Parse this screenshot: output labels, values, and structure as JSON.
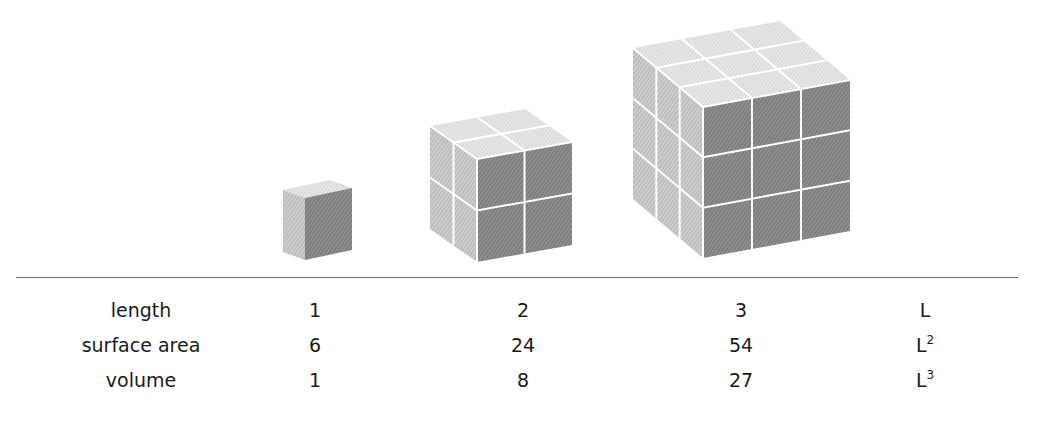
{
  "figure": {
    "title": "",
    "colors": {
      "top_face": "#e4e4e4",
      "left_face": "#c8c8c8",
      "front_face": "#8a8a8a",
      "grid_lines": "#ffffff",
      "divider": "#6d6d6d",
      "text": "#1a1a1a"
    },
    "cubes": [
      {
        "name": "cube-length-1",
        "subdivisions": 1
      },
      {
        "name": "cube-length-2",
        "subdivisions": 2
      },
      {
        "name": "cube-length-3",
        "subdivisions": 3
      }
    ]
  },
  "table": {
    "rows": [
      {
        "label": "length",
        "values": [
          "1",
          "2",
          "3"
        ],
        "general": "L",
        "exponent": ""
      },
      {
        "label": "surface area",
        "values": [
          "6",
          "24",
          "54"
        ],
        "general": "L",
        "exponent": "2"
      },
      {
        "label": "volume",
        "values": [
          "1",
          "8",
          "27"
        ],
        "general": "L",
        "exponent": "3"
      }
    ]
  }
}
